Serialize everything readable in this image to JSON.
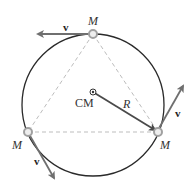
{
  "diagram": {
    "colors": {
      "circle": "#2a2a2a",
      "triangle": "#bdbdbd",
      "radius": "#4a4a4a",
      "velocity": "#6f6f6f",
      "mass_fill": "#eeeeee",
      "mass_stroke": "#a0a0a0"
    },
    "center_label": "CM",
    "radius_label": "R",
    "masses": [
      {
        "id": "top",
        "label": "M",
        "velocity_label": "v"
      },
      {
        "id": "left",
        "label": "M",
        "velocity_label": "v"
      },
      {
        "id": "right",
        "label": "M",
        "velocity_label": "v"
      }
    ]
  }
}
